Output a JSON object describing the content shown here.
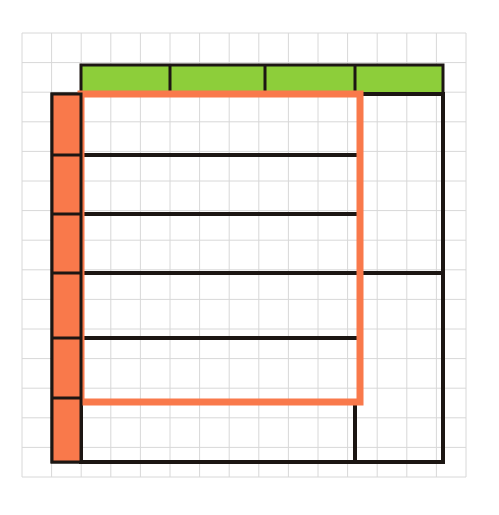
{
  "document": {
    "title": "Floor plan sketch on graph paper",
    "background_color": "#ffffff"
  },
  "grid": {
    "name": "graph-paper-grid",
    "line_color": "#d8d8d8",
    "line_width": 1,
    "cell_size": 29.6,
    "origin_x": 22,
    "origin_y": 33,
    "columns": 15,
    "rows": 15,
    "right_edge": 466,
    "bottom_edge": 477
  },
  "colors": {
    "green_fill": "#8dce3a",
    "orange_fill": "#f9794b",
    "orange_stroke": "#f9794b",
    "black_stroke": "#1c1613",
    "grid_line": "#d8d8d8",
    "paper": "#ffffff"
  },
  "shapes": {
    "green_band": {
      "name": "green-top-band",
      "label": "Green band",
      "x": 81,
      "y": 65,
      "width": 362,
      "height": 29,
      "fill": "#8dce3a",
      "stroke": "#1c1613",
      "stroke_width": 3,
      "segments": 4,
      "divider_x": [
        170,
        265,
        355
      ]
    },
    "orange_column": {
      "name": "orange-left-column",
      "label": "Orange column",
      "x": 52,
      "y": 94,
      "width": 29,
      "height": 368,
      "fill": "#f9794b",
      "stroke": "#1c1613",
      "stroke_width": 3,
      "segments": 6,
      "divider_y": [
        155,
        214,
        273,
        338,
        398
      ]
    },
    "orange_rectangle": {
      "name": "orange-outline-rectangle",
      "label": "Orange outline",
      "x": 81,
      "y": 94,
      "width": 279,
      "height": 308,
      "fill": "none",
      "stroke": "#f9794b",
      "stroke_width": 7
    },
    "outer_black_frame": {
      "name": "black-outer-frame",
      "label": "Black outline",
      "left_x": 81,
      "right_x": 443,
      "top_y": 94,
      "bottom_y": 462,
      "stroke": "#1c1613",
      "stroke_width": 4
    }
  },
  "black_lines": [
    {
      "name": "black-line-1",
      "x1": 81,
      "y1": 155,
      "x2": 355,
      "y2": 155,
      "width": 4
    },
    {
      "name": "black-line-2",
      "x1": 81,
      "y1": 214,
      "x2": 355,
      "y2": 214,
      "width": 4
    },
    {
      "name": "black-line-3",
      "x1": 81,
      "y1": 273,
      "x2": 443,
      "y2": 273,
      "width": 4
    },
    {
      "name": "black-line-4",
      "x1": 81,
      "y1": 338,
      "x2": 355,
      "y2": 338,
      "width": 4
    },
    {
      "name": "black-line-5",
      "x1": 81,
      "y1": 402,
      "x2": 355,
      "y2": 402,
      "width": 4
    },
    {
      "name": "black-line-bottom",
      "x1": 81,
      "y1": 462,
      "x2": 443,
      "y2": 462,
      "width": 4
    },
    {
      "name": "black-line-right-border",
      "x1": 443,
      "y1": 94,
      "x2": 443,
      "y2": 462,
      "width": 4
    },
    {
      "name": "black-line-mid-vertical",
      "x1": 355,
      "y1": 402,
      "x2": 355,
      "y2": 462,
      "width": 4
    },
    {
      "name": "black-line-left-vertical",
      "x1": 81,
      "y1": 402,
      "x2": 81,
      "y2": 462,
      "width": 4
    },
    {
      "name": "black-line-green-top-right",
      "x1": 355,
      "y1": 94,
      "x2": 443,
      "y2": 94,
      "width": 4
    }
  ]
}
